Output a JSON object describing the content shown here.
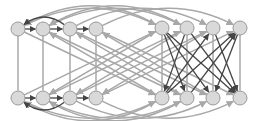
{
  "diagram": {
    "width": 257,
    "height": 121,
    "colors": {
      "node_fill": "#d9d9d9",
      "node_stroke": "#9a9a9a",
      "edge_gray": "#a8a8a8",
      "edge_dark": "#444444",
      "background": "#ffffff"
    },
    "node_radius": 7,
    "nodes": [
      {
        "id": "t0",
        "x": 18,
        "y": 29
      },
      {
        "id": "t1",
        "x": 43,
        "y": 29
      },
      {
        "id": "t2",
        "x": 70,
        "y": 29
      },
      {
        "id": "t3",
        "x": 96,
        "y": 29
      },
      {
        "id": "t4",
        "x": 162,
        "y": 28
      },
      {
        "id": "t5",
        "x": 187,
        "y": 28
      },
      {
        "id": "t6",
        "x": 213,
        "y": 28
      },
      {
        "id": "t7",
        "x": 240,
        "y": 28
      },
      {
        "id": "b0",
        "x": 18,
        "y": 98
      },
      {
        "id": "b1",
        "x": 43,
        "y": 98
      },
      {
        "id": "b2",
        "x": 70,
        "y": 98
      },
      {
        "id": "b3",
        "x": 96,
        "y": 98
      },
      {
        "id": "b4",
        "x": 162,
        "y": 98
      },
      {
        "id": "b5",
        "x": 187,
        "y": 98
      },
      {
        "id": "b6",
        "x": 213,
        "y": 98
      },
      {
        "id": "b7",
        "x": 240,
        "y": 98
      }
    ],
    "edges": [
      {
        "from": "t0",
        "to": "t1",
        "style": "dark"
      },
      {
        "from": "t1",
        "to": "t2",
        "style": "dark"
      },
      {
        "from": "t2",
        "to": "t3",
        "style": "dark"
      },
      {
        "from": "t2",
        "to": "t0",
        "style": "dark",
        "curve": "up"
      },
      {
        "from": "b0",
        "to": "b1",
        "style": "dark"
      },
      {
        "from": "b1",
        "to": "b2",
        "style": "dark"
      },
      {
        "from": "b2",
        "to": "b3",
        "style": "dark"
      },
      {
        "from": "b2",
        "to": "b0",
        "style": "dark",
        "curve": "down"
      },
      {
        "from": "t0",
        "to": "b0",
        "style": "gray",
        "arrow": false
      },
      {
        "from": "t1",
        "to": "b1",
        "style": "gray",
        "arrow": false
      },
      {
        "from": "t2",
        "to": "b2",
        "style": "gray",
        "arrow": false
      },
      {
        "from": "t3",
        "to": "b3",
        "style": "gray",
        "arrow": false
      },
      {
        "from": "t4",
        "to": "b4",
        "style": "gray",
        "arrow": false
      },
      {
        "from": "t5",
        "to": "b5",
        "style": "gray",
        "arrow": false
      },
      {
        "from": "t6",
        "to": "b6",
        "style": "gray",
        "arrow": false
      },
      {
        "from": "t7",
        "to": "b7",
        "style": "gray",
        "arrow": false
      },
      {
        "from": "t0",
        "to": "t4",
        "style": "gray",
        "curve": "up"
      },
      {
        "from": "t1",
        "to": "t5",
        "style": "gray",
        "curve": "up"
      },
      {
        "from": "t2",
        "to": "t6",
        "style": "gray",
        "curve": "up"
      },
      {
        "from": "t3",
        "to": "t7",
        "style": "gray",
        "curve": "up"
      },
      {
        "from": "t4",
        "to": "t0",
        "style": "gray",
        "curve": "up2"
      },
      {
        "from": "t5",
        "to": "t1",
        "style": "gray",
        "curve": "up2"
      },
      {
        "from": "b0",
        "to": "b4",
        "style": "gray",
        "curve": "down"
      },
      {
        "from": "b1",
        "to": "b5",
        "style": "gray",
        "curve": "down"
      },
      {
        "from": "b2",
        "to": "b6",
        "style": "gray",
        "curve": "down"
      },
      {
        "from": "b3",
        "to": "b7",
        "style": "gray",
        "curve": "down"
      },
      {
        "from": "b4",
        "to": "b0",
        "style": "gray",
        "curve": "down2"
      },
      {
        "from": "b5",
        "to": "b1",
        "style": "gray",
        "curve": "down2"
      },
      {
        "from": "t0",
        "to": "b4",
        "style": "gray"
      },
      {
        "from": "t1",
        "to": "b5",
        "style": "gray"
      },
      {
        "from": "t2",
        "to": "b6",
        "style": "gray"
      },
      {
        "from": "t3",
        "to": "b7",
        "style": "gray"
      },
      {
        "from": "b0",
        "to": "t4",
        "style": "gray"
      },
      {
        "from": "b1",
        "to": "t5",
        "style": "gray"
      },
      {
        "from": "b2",
        "to": "t6",
        "style": "gray"
      },
      {
        "from": "b3",
        "to": "t7",
        "style": "gray"
      },
      {
        "from": "t4",
        "to": "b1",
        "style": "gray"
      },
      {
        "from": "t5",
        "to": "b2",
        "style": "gray"
      },
      {
        "from": "t6",
        "to": "b3",
        "style": "gray"
      },
      {
        "from": "b4",
        "to": "t1",
        "style": "gray"
      },
      {
        "from": "b5",
        "to": "t2",
        "style": "gray"
      },
      {
        "from": "b6",
        "to": "t3",
        "style": "gray"
      },
      {
        "from": "t4",
        "to": "b5",
        "style": "dark"
      },
      {
        "from": "t5",
        "to": "b4",
        "style": "dark"
      },
      {
        "from": "t6",
        "to": "b7",
        "style": "dark"
      },
      {
        "from": "t7",
        "to": "b6",
        "style": "dark"
      },
      {
        "from": "t4",
        "to": "b6",
        "style": "dark"
      },
      {
        "from": "t5",
        "to": "b7",
        "style": "dark"
      },
      {
        "from": "b4",
        "to": "t6",
        "style": "dark"
      },
      {
        "from": "b5",
        "to": "t7",
        "style": "dark"
      },
      {
        "from": "t4",
        "to": "b7",
        "style": "dark"
      },
      {
        "from": "b4",
        "to": "t7",
        "style": "dark"
      }
    ]
  }
}
